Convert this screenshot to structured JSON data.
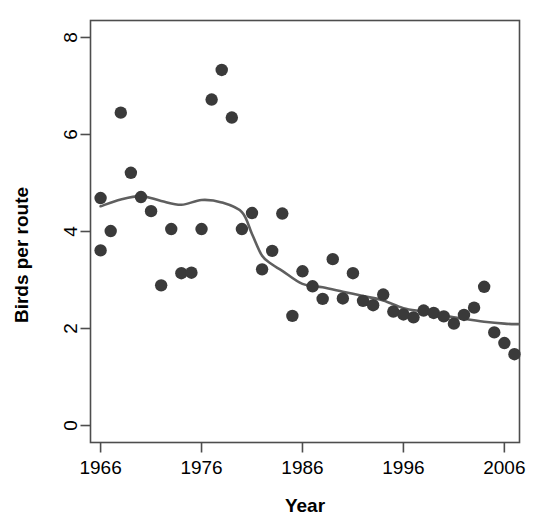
{
  "chart_data": {
    "type": "scatter",
    "title": "",
    "subtitle": "",
    "xlabel": "Year",
    "ylabel": "Birds per route",
    "xlim": [
      1965.0,
      2007.5
    ],
    "ylim": [
      -0.35,
      8.35
    ],
    "grid": false,
    "legend": null,
    "xticks": [
      1966,
      1976,
      1986,
      1996,
      2006
    ],
    "xtick_labels": [
      "1966",
      "1976",
      "1986",
      "1996",
      "2006"
    ],
    "yticks": [
      0,
      2,
      4,
      6,
      8
    ],
    "ytick_labels": [
      "0",
      "2",
      "4",
      "6",
      "8"
    ],
    "point_color": "#3a3a3a",
    "line_color": "#5f5f5f",
    "axis_color": "#4d4d4d",
    "series": [
      {
        "name": "Birds per route",
        "type": "scatter",
        "marker": "filled-circle",
        "x": [
          1966,
          1966,
          1967,
          1968,
          1969,
          1970,
          1971,
          1972,
          1973,
          1974,
          1975,
          1976,
          1977,
          1978,
          1979,
          1980,
          1981,
          1982,
          1983,
          1984,
          1985,
          1986,
          1987,
          1988,
          1989,
          1990,
          1991,
          1992,
          1993,
          1994,
          1995,
          1996,
          1997,
          1998,
          1999,
          2000,
          2001,
          2002,
          2003,
          2004,
          2005,
          2006,
          2007
        ],
        "y": [
          3.61,
          4.69,
          4.01,
          6.45,
          5.21,
          4.71,
          4.42,
          2.89,
          4.05,
          3.14,
          3.15,
          4.05,
          6.72,
          7.33,
          6.35,
          4.05,
          4.38,
          3.22,
          3.6,
          4.37,
          2.26,
          3.18,
          2.87,
          2.61,
          3.43,
          2.62,
          3.14,
          2.57,
          2.48,
          2.7,
          2.35,
          2.29,
          2.23,
          2.37,
          2.32,
          2.25,
          2.1,
          2.28,
          2.43,
          2.86,
          1.92,
          1.7,
          1.47
        ]
      },
      {
        "name": "loess smooth",
        "type": "line",
        "x": [
          1966,
          1968,
          1970,
          1972,
          1974,
          1976,
          1978,
          1980,
          1981,
          1982,
          1983,
          1984,
          1986,
          1988,
          1990,
          1992,
          1994,
          1996,
          1998,
          2000,
          2002,
          2004,
          2006,
          2007.4
        ],
        "y": [
          4.52,
          4.66,
          4.73,
          4.63,
          4.55,
          4.65,
          4.6,
          4.4,
          3.95,
          3.5,
          3.32,
          3.19,
          2.92,
          2.85,
          2.76,
          2.67,
          2.58,
          2.42,
          2.35,
          2.27,
          2.2,
          2.14,
          2.1,
          2.09
        ]
      }
    ]
  },
  "axes": {
    "x_title": "Year",
    "y_title": "Birds per route"
  }
}
